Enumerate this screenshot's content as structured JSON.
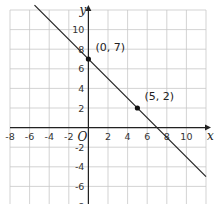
{
  "chart_data": {
    "type": "line",
    "title": "",
    "xlabel": "x",
    "ylabel": "y",
    "origin_label": "O",
    "xlim": [
      -8,
      12
    ],
    "ylim": [
      -8,
      12
    ],
    "grid": true,
    "grid_step": 2,
    "x_ticks": [
      "-8",
      "-6",
      "-4",
      "-2",
      "2",
      "4",
      "6",
      "8",
      "10"
    ],
    "y_ticks": [
      "10",
      "8",
      "6",
      "4",
      "2",
      "-2",
      "-4",
      "-6",
      "-8"
    ],
    "line": {
      "slope": -1,
      "intercept": 7,
      "equation": "y = -x + 7"
    },
    "points": [
      {
        "x": 0,
        "y": 7,
        "label": "(0, 7)"
      },
      {
        "x": 5,
        "y": 2,
        "label": "(5, 2)"
      }
    ]
  }
}
